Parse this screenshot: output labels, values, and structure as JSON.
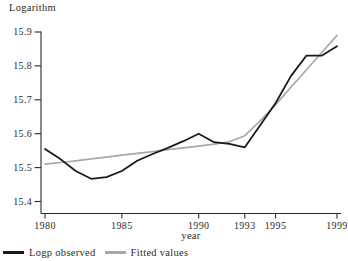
{
  "title": "Logarithm",
  "chart_data": {
    "type": "line",
    "title": "Logarithm",
    "xlabel": "year",
    "ylabel": "Logarithm",
    "xlim": [
      1980,
      1999
    ],
    "ylim": [
      15.4,
      15.9
    ],
    "x_ticks": [
      1980,
      1985,
      1990,
      1993,
      1995,
      1999
    ],
    "y_ticks": [
      15.4,
      15.5,
      15.6,
      15.7,
      15.8,
      15.9
    ],
    "grid": false,
    "legend_position": "bottom-left",
    "axis_color": "#2b2b2b",
    "x": [
      1980,
      1981,
      1982,
      1983,
      1984,
      1985,
      1986,
      1987,
      1988,
      1989,
      1990,
      1991,
      1992,
      1993,
      1994,
      1995,
      1996,
      1997,
      1998,
      1999
    ],
    "series": [
      {
        "name": "Logp observed",
        "color": "#1a1a1a",
        "width": 1.8,
        "values": [
          15.555,
          15.525,
          15.49,
          15.467,
          15.472,
          15.49,
          15.52,
          15.54,
          15.558,
          15.578,
          15.6,
          15.575,
          15.57,
          15.56,
          15.625,
          15.69,
          15.77,
          15.83,
          15.83,
          15.858
        ]
      },
      {
        "name": "Fitted values",
        "color": "#a8a8a8",
        "width": 1.7,
        "values": [
          15.51,
          15.515,
          15.52,
          15.526,
          15.531,
          15.537,
          15.542,
          15.547,
          15.553,
          15.558,
          15.563,
          15.569,
          15.576,
          15.594,
          15.638,
          15.685,
          15.737,
          15.788,
          15.839,
          15.89
        ]
      }
    ]
  }
}
